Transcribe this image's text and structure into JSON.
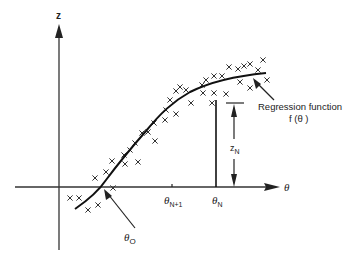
{
  "diagram": {
    "axes": {
      "y_label": "z",
      "x_label": "θ"
    },
    "ticks": [
      {
        "id": "theta_n_plus_1",
        "label": "θ",
        "sub": "N+1"
      },
      {
        "id": "theta_n",
        "label": "θ",
        "sub": "N"
      }
    ],
    "annotations": {
      "theta_o": {
        "label": "θ",
        "sub": "O"
      },
      "z_n": {
        "label": "z",
        "sub": "N"
      },
      "regression": {
        "line1": "Regression function",
        "line2": "f (θ )"
      }
    },
    "data_marker": "×",
    "points": [
      [
        70,
        198
      ],
      [
        79,
        198
      ],
      [
        88,
        210
      ],
      [
        98,
        205
      ],
      [
        113,
        188
      ],
      [
        95,
        178
      ],
      [
        106,
        172
      ],
      [
        112,
        161
      ],
      [
        125,
        164
      ],
      [
        124,
        155
      ],
      [
        138,
        162
      ],
      [
        130,
        150
      ],
      [
        135,
        143
      ],
      [
        142,
        133
      ],
      [
        148,
        132
      ],
      [
        155,
        141
      ],
      [
        154,
        123
      ],
      [
        165,
        120
      ],
      [
        166,
        110
      ],
      [
        176,
        114
      ],
      [
        170,
        100
      ],
      [
        176,
        91
      ],
      [
        180,
        87
      ],
      [
        186,
        90
      ],
      [
        191,
        103
      ],
      [
        203,
        93
      ],
      [
        202,
        85
      ],
      [
        206,
        80
      ],
      [
        214,
        93
      ],
      [
        214,
        76
      ],
      [
        222,
        76
      ],
      [
        229,
        67
      ],
      [
        238,
        69
      ],
      [
        244,
        66
      ],
      [
        250,
        64
      ],
      [
        263,
        60
      ],
      [
        240,
        82
      ],
      [
        250,
        88
      ],
      [
        267,
        80
      ],
      [
        258,
        70
      ],
      [
        226,
        94
      ],
      [
        212,
        103
      ]
    ]
  }
}
